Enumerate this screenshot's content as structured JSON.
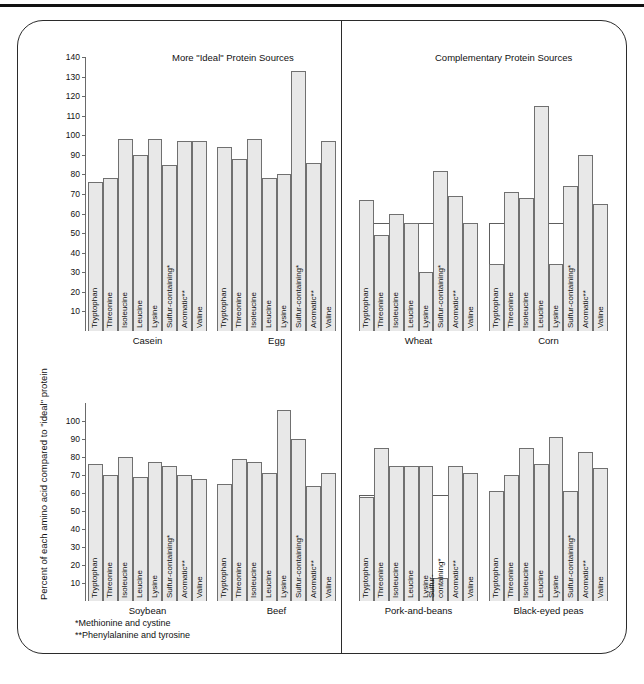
{
  "figure": {
    "y_axis_label": "Percent of each amino acid compared to \"ideal\" protein",
    "panel_titles": {
      "left": "More \"Ideal\" Protein Sources",
      "right": "Complementary Protein Sources"
    },
    "footnotes": [
      "*Methionine and cystine",
      "**Phenylalanine and tyrosine"
    ],
    "bar_fill": "#e8e8e8",
    "bar_stroke": "#707070",
    "frame_stroke": "#2b2b2b"
  },
  "chart_data": {
    "type": "bar",
    "title": "Percent of each amino acid compared to \"ideal\" protein",
    "xlabel": "",
    "ylabel": "Percent of each amino acid compared to \"ideal\" protein",
    "grid": false,
    "legend": "none",
    "categories": [
      "Tryptophan",
      "Threonine",
      "Isoleucine",
      "Leucine",
      "Lysine",
      "Sulfur-containing*",
      "Aromatic**",
      "Valine"
    ],
    "subplots": [
      {
        "group": "More \"Ideal\" Protein Sources",
        "row": 1,
        "ylim": [
          0,
          140
        ],
        "yticks": [
          10,
          20,
          30,
          40,
          50,
          60,
          70,
          80,
          90,
          100,
          110,
          120,
          130,
          140
        ],
        "series": [
          {
            "name": "Casein",
            "values": [
              76,
              78,
              98,
              90,
              98,
              85,
              97,
              97
            ]
          },
          {
            "name": "Egg",
            "values": [
              94,
              88,
              98,
              78,
              80,
              133,
              86,
              97
            ]
          }
        ]
      },
      {
        "group": "Complementary Protein Sources",
        "row": 1,
        "ylim": [
          0,
          140
        ],
        "yticks": [
          10,
          20,
          30,
          40,
          50,
          60,
          70,
          80,
          90,
          100,
          110,
          120,
          130,
          140
        ],
        "series": [
          {
            "name": "Wheat",
            "values": [
              67,
              49,
              60,
              55,
              30,
              82,
              69,
              55
            ]
          },
          {
            "name": "Corn",
            "values": [
              34,
              71,
              68,
              115,
              34,
              74,
              90,
              65
            ]
          }
        ]
      },
      {
        "group": "More \"Ideal\" Protein Sources",
        "row": 2,
        "ylim": [
          0,
          110
        ],
        "yticks": [
          10,
          20,
          30,
          40,
          50,
          60,
          70,
          80,
          90,
          100
        ],
        "series": [
          {
            "name": "Soybean",
            "values": [
              76,
              70,
              80,
              69,
              77,
              75,
              70,
              68
            ]
          },
          {
            "name": "Beef",
            "values": [
              65,
              79,
              77,
              71,
              106,
              90,
              64,
              71
            ]
          }
        ]
      },
      {
        "group": "Complementary Protein Sources",
        "row": 2,
        "ylim": [
          0,
          110
        ],
        "yticks": [
          10,
          20,
          30,
          40,
          50,
          60,
          70,
          80,
          90,
          100
        ],
        "series": [
          {
            "name": "Pork-and-beans",
            "values": [
              58,
              85,
              75,
              75,
              75,
              13,
              75,
              71
            ]
          },
          {
            "name": "Black-eyed peas",
            "values": [
              61,
              70,
              85,
              76,
              91,
              61,
              83,
              74
            ]
          }
        ]
      }
    ]
  }
}
